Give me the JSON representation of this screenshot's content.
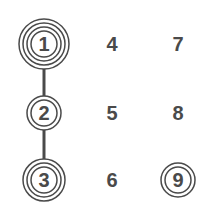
{
  "colors": {
    "ink": "#4a4a4a",
    "background": "#ffffff"
  },
  "nodes": [
    {
      "id": "1",
      "label": "1",
      "x": 44,
      "y": 44,
      "rings": 4
    },
    {
      "id": "2",
      "label": "2",
      "x": 44,
      "y": 113,
      "rings": 2
    },
    {
      "id": "3",
      "label": "3",
      "x": 44,
      "y": 180,
      "rings": 3
    },
    {
      "id": "4",
      "label": "4",
      "x": 112,
      "y": 44,
      "rings": 0
    },
    {
      "id": "5",
      "label": "5",
      "x": 112,
      "y": 113,
      "rings": 0
    },
    {
      "id": "6",
      "label": "6",
      "x": 112,
      "y": 180,
      "rings": 0
    },
    {
      "id": "7",
      "label": "7",
      "x": 178,
      "y": 44,
      "rings": 0
    },
    {
      "id": "8",
      "label": "8",
      "x": 178,
      "y": 113,
      "rings": 0
    },
    {
      "id": "9",
      "label": "9",
      "x": 178,
      "y": 180,
      "rings": 2
    }
  ],
  "edges": [
    {
      "from": "1",
      "to": "2"
    },
    {
      "from": "2",
      "to": "3"
    }
  ]
}
